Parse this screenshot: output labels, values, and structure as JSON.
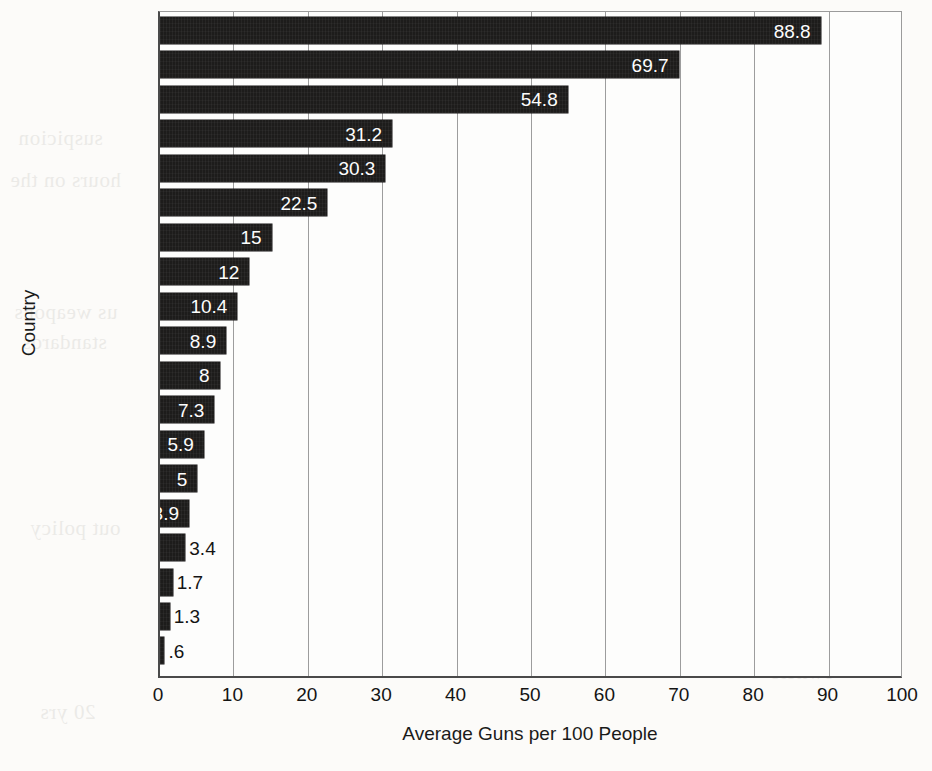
{
  "chart_data": {
    "type": "bar",
    "orientation": "horizontal",
    "title": "",
    "xlabel": "Average Guns per 100 People",
    "ylabel": "Country",
    "xlim": [
      0,
      100
    ],
    "xticks": [
      0,
      10,
      20,
      30,
      40,
      50,
      60,
      70,
      80,
      90,
      100
    ],
    "xtick_labels": [
      "0",
      "10",
      "20",
      "30",
      "40",
      "50",
      "60",
      "70",
      "80",
      "90",
      "100"
    ],
    "grid": "vertical-only",
    "legend": "none",
    "bar_color": "#1d1c1b",
    "background_color": "#fcfbf9",
    "categories": [
      "United States",
      "Serbia",
      "Yemen",
      "France",
      "Germany",
      "Greece",
      "Mexico",
      "Denmark",
      "Spain",
      "Russia",
      "Brazil",
      "Israel",
      "Colombia",
      "Morocco",
      "Syria",
      "Palestine",
      "Vietnam",
      "Poland",
      "Japan"
    ],
    "values": [
      88.8,
      69.7,
      54.8,
      31.2,
      30.3,
      22.5,
      15,
      12,
      10.4,
      8.9,
      8,
      7.3,
      5.9,
      5,
      3.9,
      3.4,
      1.7,
      1.3,
      0.6
    ],
    "value_labels": [
      "88.8",
      "69.7",
      "54.8",
      "31.2",
      "30.3",
      "22.5",
      "15",
      "12",
      "10.4",
      "8.9",
      "8",
      "7.3",
      "5.9",
      "5",
      "3.9",
      "3.4",
      "1.7",
      "1.3",
      ".6"
    ],
    "label_placement": [
      "inside",
      "inside",
      "inside",
      "inside",
      "inside",
      "inside",
      "inside",
      "inside",
      "inside",
      "inside",
      "inside",
      "inside",
      "inside",
      "inside",
      "inside",
      "outside",
      "outside",
      "outside",
      "outside"
    ]
  },
  "ghost_text": [
    {
      "text": "suspicion",
      "x": 18,
      "y": 126
    },
    {
      "text": "hours on the",
      "x": 10,
      "y": 168
    },
    {
      "text": "us weapons",
      "x": 14,
      "y": 300
    },
    {
      "text": "standards",
      "x": 22,
      "y": 330
    },
    {
      "text": "out policy",
      "x": 30,
      "y": 516
    },
    {
      "text": "20 yrs",
      "x": 40,
      "y": 700
    },
    {
      "text": "of the",
      "x": 470,
      "y": 96
    },
    {
      "text": "control",
      "x": 505,
      "y": 202
    },
    {
      "text": "safety",
      "x": 560,
      "y": 262
    },
    {
      "text": "the US",
      "x": 600,
      "y": 340
    },
    {
      "text": "firearm",
      "x": 640,
      "y": 430
    },
    {
      "text": "reform",
      "x": 690,
      "y": 520
    },
    {
      "text": "policy",
      "x": 735,
      "y": 600
    },
    {
      "text": "owners",
      "x": 770,
      "y": 660
    }
  ]
}
